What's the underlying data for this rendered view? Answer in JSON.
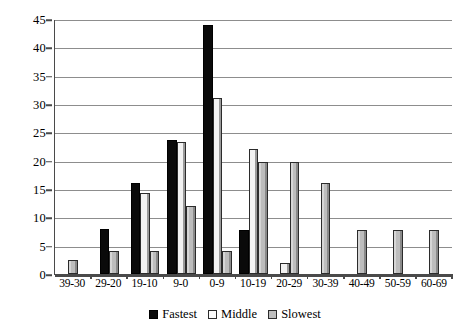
{
  "chart_data": {
    "type": "bar",
    "title": "",
    "subtitle": "",
    "xlabel": "",
    "ylabel": "",
    "ylim": [
      0,
      45
    ],
    "ytick_step": 5,
    "yticks": [
      0,
      5,
      10,
      15,
      20,
      25,
      30,
      35,
      40,
      45
    ],
    "grid": "horizontal",
    "legend_position": "bottom-center",
    "categories": [
      "39-30",
      "29-20",
      "19-10",
      "9-0",
      "0-9",
      "10-19",
      "20-29",
      "30-39",
      "40-49",
      "50-59",
      "60-69"
    ],
    "series": [
      {
        "name": "Fastest",
        "color": "#0a0a0a",
        "values": [
          0,
          8,
          16,
          23.7,
          44,
          7.7,
          0,
          0,
          0,
          0,
          0
        ]
      },
      {
        "name": "Middle",
        "color": "#f2f2f2",
        "values": [
          0,
          0,
          14.3,
          23.3,
          31,
          22,
          2,
          0,
          0,
          0,
          0
        ]
      },
      {
        "name": "Slowest",
        "color": "#bdbdbd",
        "values": [
          2.5,
          4,
          4,
          12,
          4,
          19.8,
          19.7,
          16,
          7.7,
          7.7,
          7.7
        ]
      }
    ]
  },
  "axis_color": "#4a4a4a",
  "gridline_color": "#8d8d8d"
}
